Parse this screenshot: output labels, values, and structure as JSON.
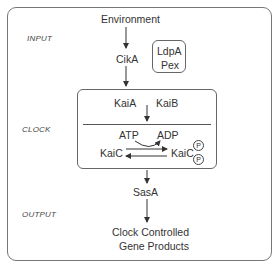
{
  "diagram": {
    "stage_labels": {
      "input": "INPUT",
      "clock": "CLOCK",
      "output": "OUTPUT"
    },
    "nodes": {
      "environment": "Environment",
      "cika": "CikA",
      "ldpa": "LdpA",
      "pex": "Pex",
      "kaia": "KaiA",
      "kaib": "KaiB",
      "atp": "ATP",
      "adp": "ADP",
      "kaic": "KaiC",
      "kaic_p": "KaiC",
      "phospho_1": "P",
      "phospho_2": "P",
      "sasa": "SasA",
      "output_line1": "Clock Controlled",
      "output_line2": "Gene Products"
    },
    "edges": [
      {
        "from": "Environment",
        "to": "CikA"
      },
      {
        "from": "CikA",
        "to": "Clock"
      },
      {
        "from": "KaiA/KaiB",
        "to": "KaiC cycle"
      },
      {
        "from": "ATP",
        "to": "ADP"
      },
      {
        "from": "KaiC",
        "to": "KaiC-PP",
        "type": "forward"
      },
      {
        "from": "KaiC-PP",
        "to": "KaiC",
        "type": "reverse"
      },
      {
        "from": "Clock",
        "to": "SasA"
      },
      {
        "from": "SasA",
        "to": "Clock Controlled Gene Products"
      }
    ],
    "colors": {
      "line": "#555555",
      "text": "#333333",
      "background": "#ffffff"
    }
  }
}
